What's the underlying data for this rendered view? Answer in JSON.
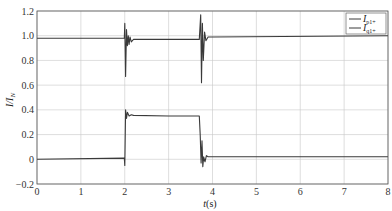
{
  "chart_data": {
    "type": "line",
    "title": "",
    "xlabel": "t(s)",
    "ylabel": "I/I_N",
    "xlim": [
      0,
      8
    ],
    "ylim": [
      -0.2,
      1.2
    ],
    "xticks": [
      "0",
      "1",
      "2",
      "3",
      "4",
      "5",
      "6",
      "7",
      "8"
    ],
    "yticks": [
      "1.2",
      "1.0",
      "0.8",
      "0.6",
      "0.4",
      "0.2",
      "0",
      "−0.2"
    ],
    "grid": true,
    "legend_position": "top-right",
    "series": [
      {
        "name": "I_p1+",
        "x": [
          0,
          1.99,
          2.0,
          2.02,
          2.04,
          2.06,
          2.08,
          2.1,
          2.12,
          2.15,
          2.2,
          2.3,
          3.0,
          3.7,
          3.73,
          3.75,
          3.77,
          3.79,
          3.82,
          3.85,
          3.9,
          4.0,
          8.0
        ],
        "values": [
          0.98,
          0.98,
          1.1,
          0.67,
          1.05,
          0.92,
          1.0,
          0.93,
          0.99,
          0.95,
          0.97,
          0.97,
          0.97,
          0.97,
          1.17,
          0.62,
          1.1,
          0.8,
          1.03,
          0.96,
          0.99,
          0.99,
          1.0
        ]
      },
      {
        "name": "I_q1+",
        "x": [
          0,
          1.99,
          2.0,
          2.02,
          2.04,
          2.06,
          2.1,
          2.15,
          2.2,
          3.0,
          3.7,
          3.72,
          3.74,
          3.76,
          3.78,
          3.8,
          3.83,
          3.86,
          3.9,
          4.0,
          8.0
        ],
        "values": [
          0.0,
          0.01,
          -0.05,
          0.4,
          0.33,
          0.38,
          0.35,
          0.36,
          0.355,
          0.35,
          0.35,
          0.2,
          -0.03,
          0.15,
          -0.06,
          0.02,
          -0.02,
          0.03,
          0.02,
          0.02,
          0.02
        ]
      }
    ]
  },
  "legend": {
    "items": [
      {
        "main": "I",
        "sub": "p1+"
      },
      {
        "main": "I",
        "sub": "q1+"
      }
    ]
  },
  "axes": {
    "xlabel_main": "t",
    "xlabel_unit": "(s)",
    "ylabel_main": "I/I",
    "ylabel_sub": "N"
  },
  "colors": {
    "line": "#3a3a3a",
    "grid": "#c8c8c8",
    "axis": "#555555"
  }
}
